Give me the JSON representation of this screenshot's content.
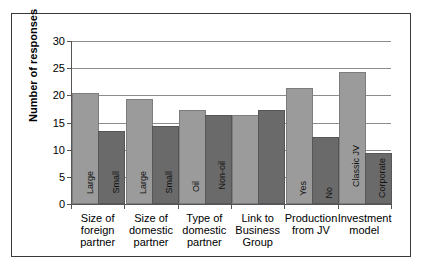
{
  "chart_data": {
    "type": "bar",
    "title": "",
    "subtitle": "",
    "xlabel": "",
    "ylabel": "Number of responses",
    "ylim": [
      0,
      30
    ],
    "yticks": [
      0,
      5,
      10,
      15,
      20,
      25,
      30
    ],
    "ytick_labels": [
      "0",
      "5",
      "10",
      "15",
      "20",
      "25",
      "30"
    ],
    "grid": "horizontal",
    "legend": "none",
    "categories": [
      "Size of foreign partner",
      "Size of domestic partner",
      "Type of domestic partner",
      "Link to Business Group",
      "Production from JV",
      "Investment model"
    ],
    "category_lines": [
      [
        "Size of",
        "foreign",
        "partner"
      ],
      [
        "Size of",
        "domestic",
        "partner"
      ],
      [
        "Type of",
        "domestic",
        "partner"
      ],
      [
        "Link to",
        "Business",
        "Group"
      ],
      [
        "Production",
        "from JV"
      ],
      [
        "Investment",
        "model"
      ]
    ],
    "series": [
      {
        "name": "first-option",
        "color": "#9b9b9b",
        "values": [
          20,
          19,
          17,
          16,
          21,
          24
        ],
        "point_labels": [
          "Large",
          "Large",
          "Oil",
          "",
          "Yes",
          "Classic JV"
        ]
      },
      {
        "name": "second-option",
        "color": "#6a6a6a",
        "values": [
          13,
          14,
          16,
          17,
          12,
          9
        ],
        "point_labels": [
          "Small",
          "Small",
          "Non-oil",
          "",
          "No",
          "Corporate"
        ]
      }
    ],
    "colors": {
      "series_light": "#9b9b9b",
      "series_dark": "#6a6a6a",
      "gridline": "#8c8c8c",
      "axis": "#555555",
      "frame_border": "#3a3a3a",
      "background": "#ffffff",
      "text": "#000000"
    }
  }
}
